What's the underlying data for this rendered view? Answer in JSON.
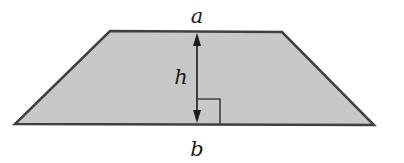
{
  "diagram": {
    "shape": "trapezoid",
    "labels": {
      "top_base": "a",
      "bottom_base": "b",
      "height": "h"
    },
    "colors": {
      "fill": "#c8c8c8",
      "stroke": "#404040",
      "arrow": "#1a1a1a",
      "text": "#1a1a1a"
    },
    "vertices": {
      "top_left": [
        110,
        31
      ],
      "top_right": [
        282,
        32
      ],
      "bottom_right": [
        374,
        125
      ],
      "bottom_left": [
        15,
        124
      ]
    },
    "height_line": {
      "x": 197,
      "y_top": 32,
      "y_bottom": 124
    },
    "right_angle_marker": {
      "x": 197,
      "y": 99,
      "size": 23
    }
  }
}
